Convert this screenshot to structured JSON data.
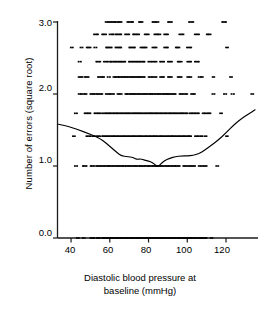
{
  "chart_data": {
    "type": "scatter",
    "title": "",
    "xlabel": "Diastolic blood pressure at baseline (mmHg)",
    "xlabel_lines": [
      "Diastolic blood pressure at",
      "baseline (mmHg)"
    ],
    "ylabel": "Number of errors (square root)",
    "xlim": [
      33,
      136
    ],
    "ylim": [
      -0.08,
      3.05
    ],
    "xticks": [
      40,
      60,
      80,
      100,
      120
    ],
    "xtick_labels": [
      "40",
      "60",
      "80",
      "100",
      "120"
    ],
    "yticks": [
      0.0,
      1.0,
      2.0,
      3.0
    ],
    "ytick_labels": [
      "0.0",
      "1.0",
      "2.0",
      "3.0"
    ],
    "grid": false,
    "legend": null,
    "marker": "square-dot",
    "marker_color": "#000000",
    "line_color": "#000000",
    "axis_color": "#000000",
    "note": "Scatter of square-root transformed error counts vs diastolic blood pressure; discrete sqrt levels form horizontal bands. A smoothed (lowess) curve is overlaid.",
    "y_levels": [
      0.0,
      1.0,
      1.414,
      1.732,
      2.0,
      2.236,
      2.449,
      2.646,
      2.828,
      3.0
    ],
    "bands": [
      {
        "y": 3.0,
        "x_runs": [
          [
            58,
            66
          ],
          [
            69,
            72
          ],
          [
            75,
            77
          ],
          [
            82,
            85
          ],
          [
            90,
            92
          ],
          [
            101,
            103
          ],
          [
            118,
            120
          ]
        ]
      },
      {
        "y": 2.828,
        "x_runs": [
          [
            52,
            54
          ],
          [
            56,
            58
          ],
          [
            60,
            62
          ],
          [
            63,
            66
          ],
          [
            68,
            70
          ],
          [
            72,
            75
          ],
          [
            78,
            80
          ],
          [
            83,
            86
          ],
          [
            88,
            90
          ],
          [
            96,
            98
          ],
          [
            104,
            106
          ],
          [
            110,
            112
          ]
        ]
      },
      {
        "y": 2.646,
        "x_runs": [
          [
            40,
            41
          ],
          [
            45,
            46
          ],
          [
            48,
            50
          ],
          [
            52,
            53
          ],
          [
            58,
            61
          ],
          [
            63,
            66
          ],
          [
            70,
            73
          ],
          [
            76,
            79
          ],
          [
            82,
            84
          ],
          [
            88,
            90
          ],
          [
            94,
            96
          ],
          [
            100,
            102
          ],
          [
            120,
            121
          ]
        ]
      },
      {
        "y": 2.449,
        "x_runs": [
          [
            44,
            45
          ],
          [
            53,
            55
          ],
          [
            57,
            59
          ],
          [
            60,
            68
          ],
          [
            70,
            78
          ],
          [
            80,
            84
          ],
          [
            86,
            88
          ],
          [
            90,
            92
          ],
          [
            95,
            97
          ],
          [
            100,
            102
          ],
          [
            104,
            106
          ]
        ]
      },
      {
        "y": 2.236,
        "x_runs": [
          [
            44,
            46
          ],
          [
            47,
            49
          ],
          [
            54,
            57
          ],
          [
            59,
            60
          ],
          [
            62,
            78
          ],
          [
            80,
            84
          ],
          [
            86,
            88
          ],
          [
            90,
            92
          ],
          [
            95,
            97
          ],
          [
            100,
            102
          ],
          [
            106,
            108
          ],
          [
            113,
            114
          ],
          [
            122,
            123
          ]
        ]
      },
      {
        "y": 2.0,
        "x_runs": [
          [
            44,
            48
          ],
          [
            50,
            56
          ],
          [
            58,
            62
          ],
          [
            64,
            66
          ],
          [
            68,
            94
          ],
          [
            96,
            100
          ],
          [
            102,
            104
          ],
          [
            113,
            114
          ],
          [
            119,
            120
          ],
          [
            123,
            124
          ],
          [
            133,
            134
          ]
        ]
      },
      {
        "y": 1.732,
        "x_runs": [
          [
            42,
            43
          ],
          [
            47,
            50
          ],
          [
            52,
            56
          ],
          [
            57,
            100
          ],
          [
            101,
            106
          ],
          [
            108,
            112
          ],
          [
            117,
            118
          ]
        ]
      },
      {
        "y": 1.414,
        "x_runs": [
          [
            41,
            42
          ],
          [
            48,
            50
          ],
          [
            51,
            55
          ],
          [
            56,
            102
          ],
          [
            104,
            108
          ],
          [
            109,
            110
          ],
          [
            120,
            121
          ]
        ]
      },
      {
        "y": 1.0,
        "x_runs": [
          [
            42,
            43
          ],
          [
            46,
            48
          ],
          [
            50,
            52
          ],
          [
            53,
            96
          ],
          [
            98,
            104
          ],
          [
            106,
            110
          ],
          [
            115,
            116
          ]
        ]
      },
      {
        "y": 0.0,
        "x_runs": [
          [
            43,
            44
          ],
          [
            46,
            47
          ],
          [
            50,
            52
          ],
          [
            53,
            55
          ],
          [
            56,
            110
          ],
          [
            112,
            113
          ]
        ]
      }
    ],
    "smooth_curve": {
      "name": "lowess-smoother",
      "points": [
        [
          33.5,
          1.58
        ],
        [
          37,
          1.56
        ],
        [
          41,
          1.53
        ],
        [
          45,
          1.49
        ],
        [
          49,
          1.45
        ],
        [
          52,
          1.42
        ],
        [
          55,
          1.38
        ],
        [
          58,
          1.32
        ],
        [
          61,
          1.25
        ],
        [
          64,
          1.18
        ],
        [
          66,
          1.14
        ],
        [
          69,
          1.13
        ],
        [
          72,
          1.12
        ],
        [
          74,
          1.09
        ],
        [
          76,
          1.1
        ],
        [
          78,
          1.08
        ],
        [
          80,
          1.07
        ],
        [
          82,
          1.05
        ],
        [
          84,
          1.0
        ],
        [
          85,
          0.99
        ],
        [
          86,
          1.02
        ],
        [
          88,
          1.07
        ],
        [
          91,
          1.11
        ],
        [
          94,
          1.13
        ],
        [
          97,
          1.14
        ],
        [
          100,
          1.14
        ],
        [
          103,
          1.15
        ],
        [
          106,
          1.17
        ],
        [
          109,
          1.22
        ],
        [
          112,
          1.28
        ],
        [
          116,
          1.36
        ],
        [
          120,
          1.46
        ],
        [
          124,
          1.57
        ],
        [
          128,
          1.66
        ],
        [
          132,
          1.73
        ],
        [
          135,
          1.78
        ]
      ]
    }
  }
}
